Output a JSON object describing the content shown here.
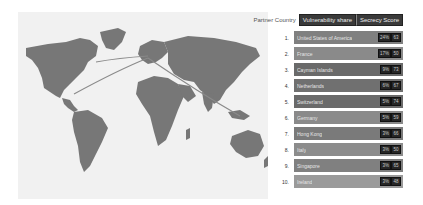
{
  "header": {
    "label": "Partner Country",
    "segments": [
      "Vulnerability share",
      "Secrecy Score"
    ]
  },
  "map": {
    "land_color": "#777777",
    "ocean_color": "#f1f1f1",
    "arc_color": "#8a8a8a",
    "origin": "Europe",
    "arc_destinations": [
      "United States of America",
      "Cayman Islands",
      "Singapore"
    ]
  },
  "rows": [
    {
      "rank": "1.",
      "country": "United States of America",
      "share": "24%",
      "score": "63",
      "shade": "#808080"
    },
    {
      "rank": "2.",
      "country": "France",
      "share": "17%",
      "score": "50",
      "shade": "#8a8a8a"
    },
    {
      "rank": "3.",
      "country": "Cayman Islands",
      "share": "9%",
      "score": "73",
      "shade": "#6a6a6a"
    },
    {
      "rank": "4.",
      "country": "Netherlands",
      "share": "6%",
      "score": "67",
      "shade": "#707070"
    },
    {
      "rank": "5.",
      "country": "Switzerland",
      "share": "5%",
      "score": "74",
      "shade": "#6a6a6a"
    },
    {
      "rank": "6.",
      "country": "Germany",
      "share": "5%",
      "score": "59",
      "shade": "#8a8a8a"
    },
    {
      "rank": "7.",
      "country": "Hong Kong",
      "share": "3%",
      "score": "66",
      "shade": "#7a7a7a"
    },
    {
      "rank": "8.",
      "country": "Italy",
      "share": "3%",
      "score": "50",
      "shade": "#8c8c8c"
    },
    {
      "rank": "9.",
      "country": "Singapore",
      "share": "3%",
      "score": "65",
      "shade": "#808080"
    },
    {
      "rank": "10.",
      "country": "Ireland",
      "share": "3%",
      "score": "48",
      "shade": "#9a9a9a"
    }
  ]
}
